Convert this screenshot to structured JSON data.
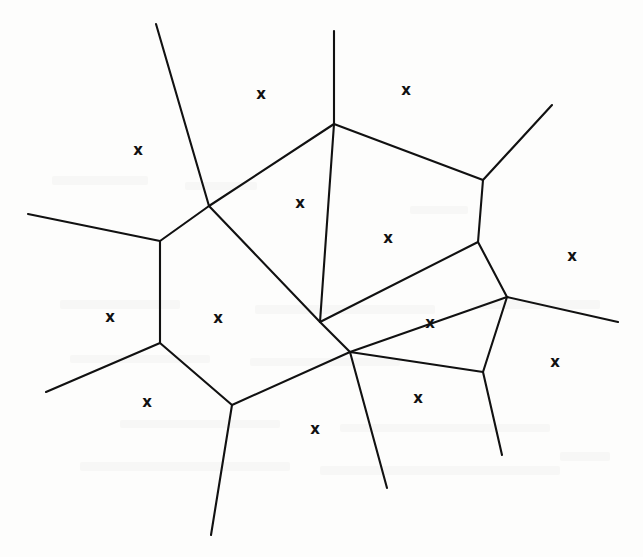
{
  "figure": {
    "kind": "voronoi-diagram",
    "title": "",
    "caption": "",
    "width": 643,
    "height": 557,
    "background_color": "#fdfdfc",
    "line_color": "#111111",
    "line_width": 2.1,
    "site_glyph": "x",
    "site_glyph_color": "#111111",
    "site_count": 16,
    "vertex_count": 11,
    "edge_count": 25
  },
  "chart_data": {
    "type": "scatter",
    "title": "",
    "xlabel": "",
    "ylabel": "",
    "xlim": [
      0,
      643
    ],
    "ylim": [
      0,
      557
    ],
    "grid": false,
    "legend": null,
    "sites": [
      {
        "id": "s1",
        "label": "x",
        "x": 261,
        "y": 94
      },
      {
        "id": "s2",
        "label": "x",
        "x": 406,
        "y": 90
      },
      {
        "id": "s3",
        "label": "x",
        "x": 138,
        "y": 150
      },
      {
        "id": "s4",
        "label": "x",
        "x": 300,
        "y": 203
      },
      {
        "id": "s5",
        "label": "x",
        "x": 388,
        "y": 238
      },
      {
        "id": "s6",
        "label": "x",
        "x": 572,
        "y": 256
      },
      {
        "id": "s7",
        "label": "x",
        "x": 110,
        "y": 317
      },
      {
        "id": "s8",
        "label": "x",
        "x": 218,
        "y": 318
      },
      {
        "id": "s9",
        "label": "x",
        "x": 430,
        "y": 323
      },
      {
        "id": "s10",
        "label": "x",
        "x": 555,
        "y": 362
      },
      {
        "id": "s11",
        "label": "x",
        "x": 147,
        "y": 402
      },
      {
        "id": "s12",
        "label": "x",
        "x": 418,
        "y": 398
      },
      {
        "id": "s13",
        "label": "x",
        "x": 315,
        "y": 429
      }
    ],
    "vertices": [
      {
        "id": "v1",
        "x": 209,
        "y": 206
      },
      {
        "id": "v2",
        "x": 334,
        "y": 124
      },
      {
        "id": "v3",
        "x": 483,
        "y": 180
      },
      {
        "id": "v4",
        "x": 160,
        "y": 241
      },
      {
        "id": "v5",
        "x": 478,
        "y": 242
      },
      {
        "id": "v6",
        "x": 507,
        "y": 297
      },
      {
        "id": "v7",
        "x": 320,
        "y": 322
      },
      {
        "id": "v8",
        "x": 160,
        "y": 343
      },
      {
        "id": "v9",
        "x": 350,
        "y": 352
      },
      {
        "id": "v10",
        "x": 483,
        "y": 372
      },
      {
        "id": "v11",
        "x": 232,
        "y": 405
      }
    ],
    "interior_edges": [
      {
        "from": "v1",
        "to": "v2"
      },
      {
        "from": "v2",
        "to": "v3"
      },
      {
        "from": "v2",
        "to": "v7"
      },
      {
        "from": "v3",
        "to": "v5"
      },
      {
        "from": "v5",
        "to": "v6"
      },
      {
        "from": "v5",
        "to": "v7"
      },
      {
        "from": "v6",
        "to": "v9"
      },
      {
        "from": "v6",
        "to": "v10"
      },
      {
        "from": "v1",
        "to": "v4"
      },
      {
        "from": "v1",
        "to": "v7"
      },
      {
        "from": "v4",
        "to": "v8"
      },
      {
        "from": "v7",
        "to": "v9"
      },
      {
        "from": "v8",
        "to": "v11"
      },
      {
        "from": "v9",
        "to": "v10"
      },
      {
        "from": "v9",
        "to": "v11"
      }
    ],
    "unbounded_rays": [
      {
        "from": "v1",
        "to_x": 156,
        "to_y": 24
      },
      {
        "from": "v2",
        "to_x": 334,
        "to_y": 31
      },
      {
        "from": "v3",
        "to_x": 552,
        "to_y": 105
      },
      {
        "from": "v4",
        "to_x": 28,
        "to_y": 214
      },
      {
        "from": "v6",
        "to_x": 618,
        "to_y": 322
      },
      {
        "from": "v8",
        "to_x": 46,
        "to_y": 392
      },
      {
        "from": "v9",
        "to_x": 387,
        "to_y": 488
      },
      {
        "from": "v10",
        "to_x": 502,
        "to_y": 455
      },
      {
        "from": "v11",
        "to_x": 211,
        "to_y": 535
      }
    ]
  },
  "scan_artifacts": [
    {
      "x": 52,
      "y": 176,
      "w": 96,
      "h": 9
    },
    {
      "x": 185,
      "y": 182,
      "w": 72,
      "h": 8
    },
    {
      "x": 410,
      "y": 206,
      "w": 58,
      "h": 8
    },
    {
      "x": 60,
      "y": 300,
      "w": 120,
      "h": 9
    },
    {
      "x": 255,
      "y": 305,
      "w": 180,
      "h": 9
    },
    {
      "x": 470,
      "y": 300,
      "w": 130,
      "h": 9
    },
    {
      "x": 70,
      "y": 355,
      "w": 140,
      "h": 8
    },
    {
      "x": 250,
      "y": 358,
      "w": 150,
      "h": 8
    },
    {
      "x": 120,
      "y": 420,
      "w": 160,
      "h": 8
    },
    {
      "x": 340,
      "y": 424,
      "w": 210,
      "h": 8
    },
    {
      "x": 80,
      "y": 462,
      "w": 210,
      "h": 9
    },
    {
      "x": 320,
      "y": 466,
      "w": 240,
      "h": 9
    },
    {
      "x": 560,
      "y": 452,
      "w": 50,
      "h": 9
    }
  ]
}
